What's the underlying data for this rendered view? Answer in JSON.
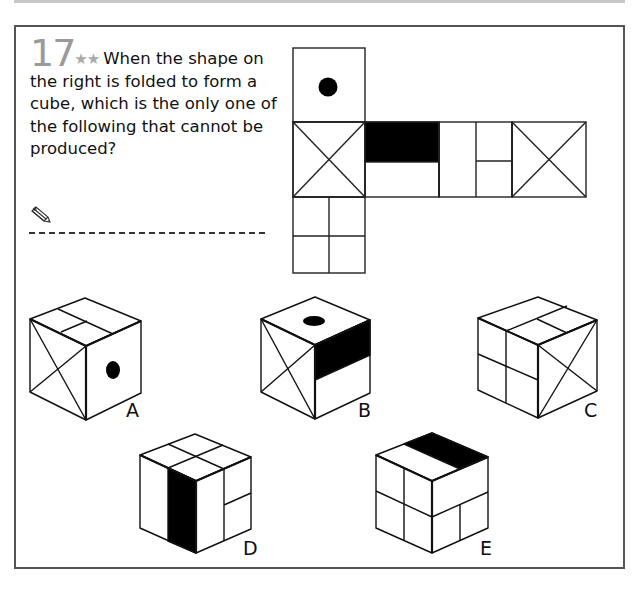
{
  "question": {
    "number": "17",
    "difficulty_stars": "★★",
    "text": "When the shape on the right is folded to form a cube, which is the only one of the following that cannot be produced?"
  },
  "answer_area": {
    "icon": "pencil-icon",
    "line": "dashed answer line"
  },
  "net": {
    "description": "Cube net (6 faces)",
    "faces": [
      {
        "position": "top-left",
        "pattern": "black dot"
      },
      {
        "position": "row-1",
        "pattern": "X diagonals"
      },
      {
        "position": "row-2",
        "pattern": "top half black"
      },
      {
        "position": "row-3",
        "pattern": "vertical split, right half split horizontally"
      },
      {
        "position": "row-4",
        "pattern": "X diagonals"
      },
      {
        "position": "bottom-left",
        "pattern": "four quadrants"
      }
    ]
  },
  "options": [
    {
      "label": "A"
    },
    {
      "label": "B"
    },
    {
      "label": "C"
    },
    {
      "label": "D"
    },
    {
      "label": "E"
    }
  ],
  "colors": {
    "frame": "#555555",
    "number": "#9a9a9a",
    "stars": "#aaaaaa",
    "ink": "#111111"
  }
}
